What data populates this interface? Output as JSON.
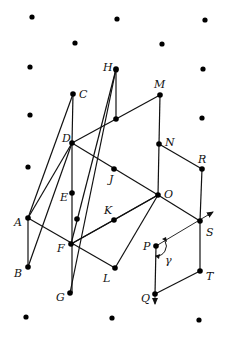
{
  "diagram": {
    "type": "lattice-geometry",
    "colors": {
      "line": "#111111",
      "point": "#000000",
      "background": "#ffffff"
    },
    "lattice_dots": [
      [
        32,
        17
      ],
      [
        117,
        19
      ],
      [
        205,
        20
      ],
      [
        75,
        43
      ],
      [
        162,
        44
      ],
      [
        30,
        67
      ],
      [
        116,
        70
      ],
      [
        203,
        69
      ],
      [
        30,
        115
      ],
      [
        202,
        118
      ],
      [
        28,
        167
      ],
      [
        26,
        317
      ],
      [
        112,
        318
      ],
      [
        199,
        320
      ]
    ],
    "points": [
      {
        "id": "A",
        "label": "A",
        "x": 28,
        "y": 218,
        "lx": 14,
        "ly": 226
      },
      {
        "id": "B",
        "label": "B",
        "x": 28,
        "y": 267,
        "lx": 14,
        "ly": 277
      },
      {
        "id": "C",
        "label": "C",
        "x": 73,
        "y": 94,
        "lx": 79,
        "ly": 98
      },
      {
        "id": "D",
        "label": "D",
        "x": 72,
        "y": 143,
        "lx": 62,
        "ly": 142
      },
      {
        "id": "E",
        "label": "E",
        "x": 72,
        "y": 193,
        "lx": 60,
        "ly": 201
      },
      {
        "id": "F",
        "label": "F",
        "x": 71,
        "y": 244,
        "lx": 57,
        "ly": 252
      },
      {
        "id": "G",
        "label": "G",
        "x": 70,
        "y": 293,
        "lx": 56,
        "ly": 301
      },
      {
        "id": "H",
        "label": "H",
        "x": 116,
        "y": 69,
        "lx": 103,
        "ly": 71
      },
      {
        "id": "J",
        "label": "J",
        "x": 114,
        "y": 169,
        "lx": 109,
        "ly": 183
      },
      {
        "id": "K",
        "label": "K",
        "x": 114,
        "y": 220,
        "lx": 104,
        "ly": 214
      },
      {
        "id": "L",
        "label": "L",
        "x": 115,
        "y": 268,
        "lx": 103,
        "ly": 282
      },
      {
        "id": "M",
        "label": "M",
        "x": 160,
        "y": 95,
        "lx": 154,
        "ly": 88
      },
      {
        "id": "N",
        "label": "N",
        "x": 159,
        "y": 144,
        "lx": 165,
        "ly": 146
      },
      {
        "id": "O",
        "label": "O",
        "x": 158,
        "y": 195,
        "lx": 164,
        "ly": 198
      },
      {
        "id": "P",
        "label": "P",
        "x": 156,
        "y": 246,
        "lx": 143,
        "ly": 250
      },
      {
        "id": "Q",
        "label": "Q",
        "x": 155,
        "y": 294,
        "lx": 141,
        "ly": 302
      },
      {
        "id": "R",
        "label": "R",
        "x": 202,
        "y": 169,
        "lx": 198,
        "ly": 163
      },
      {
        "id": "S",
        "label": "S",
        "x": 200,
        "y": 221,
        "lx": 206,
        "ly": 236
      },
      {
        "id": "T",
        "label": "T",
        "x": 200,
        "y": 271,
        "lx": 206,
        "ly": 280
      }
    ],
    "unlabeled_points": [
      [
        116,
        119
      ],
      [
        77,
        219
      ]
    ],
    "segments": [
      [
        28,
        218,
        73,
        94
      ],
      [
        73,
        94,
        72,
        143
      ],
      [
        28,
        218,
        72,
        143
      ],
      [
        28,
        218,
        28,
        267
      ],
      [
        28,
        267,
        72,
        143
      ],
      [
        28,
        218,
        115,
        268
      ],
      [
        72,
        143,
        72,
        293
      ],
      [
        72,
        143,
        160,
        95
      ],
      [
        72,
        143,
        158,
        195
      ],
      [
        70,
        293,
        116,
        69
      ],
      [
        71,
        244,
        116,
        69
      ],
      [
        116,
        69,
        116,
        119
      ],
      [
        71,
        244,
        114,
        220
      ],
      [
        114,
        220,
        158,
        195
      ],
      [
        71,
        244,
        158,
        195
      ],
      [
        115,
        268,
        158,
        195
      ],
      [
        160,
        95,
        159,
        144
      ],
      [
        159,
        144,
        158,
        195
      ],
      [
        159,
        144,
        202,
        169
      ],
      [
        202,
        169,
        200,
        221
      ],
      [
        158,
        195,
        200,
        221
      ],
      [
        200,
        221,
        200,
        271
      ],
      [
        200,
        271,
        155,
        294
      ],
      [
        156,
        246,
        155,
        294
      ]
    ],
    "arrows": [
      {
        "from": [
          156,
          246
        ],
        "to": [
          213,
          212
        ],
        "label": ""
      },
      {
        "from": [
          155,
          294
        ],
        "to": [
          155,
          304
        ],
        "label": ""
      }
    ],
    "angle": {
      "label": "γ",
      "vertex": [
        156,
        246
      ],
      "label_x": 165,
      "label_y": 264
    }
  }
}
